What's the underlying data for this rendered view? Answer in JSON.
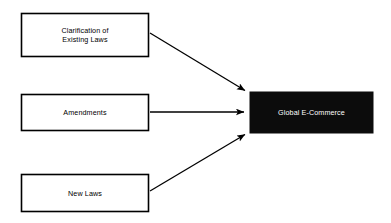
{
  "diagram": {
    "type": "flow-convergence",
    "background_color": "#ffffff",
    "source_nodes": [
      {
        "id": "clarification-of-existing-laws",
        "label": "Clarification of\nExisting Laws",
        "fill_color": "#ffffff",
        "border_color": "#000000",
        "text_color": "#000000",
        "x": 21,
        "y": 13,
        "width": 128,
        "height": 44
      },
      {
        "id": "amendments",
        "label": "Amendments",
        "fill_color": "#ffffff",
        "border_color": "#000000",
        "text_color": "#000000",
        "x": 21,
        "y": 94,
        "width": 128,
        "height": 37
      },
      {
        "id": "new-laws",
        "label": "New Laws",
        "fill_color": "#ffffff",
        "border_color": "#000000",
        "text_color": "#000000",
        "x": 21,
        "y": 174,
        "width": 128,
        "height": 38
      }
    ],
    "target_node": {
      "id": "global-e-commerce",
      "label": "Global E-Commerce",
      "fill_color": "#0c0c0c",
      "border_color": "#0c0c0c",
      "text_color": "#ffffff",
      "x": 250,
      "y": 92,
      "width": 123,
      "height": 41
    },
    "connectors": [
      {
        "id": "arrow-clarification-to-global",
        "from": "clarification-of-existing-laws",
        "to": "global-e-commerce",
        "x1": 150,
        "y1": 33,
        "x2": 247,
        "y2": 92,
        "color": "#000000"
      },
      {
        "id": "arrow-amendments-to-global",
        "from": "amendments",
        "to": "global-e-commerce",
        "x1": 150,
        "y1": 112,
        "x2": 247,
        "y2": 112,
        "color": "#000000"
      },
      {
        "id": "arrow-new-laws-to-global",
        "from": "new-laws",
        "to": "global-e-commerce",
        "x1": 150,
        "y1": 191,
        "x2": 247,
        "y2": 133,
        "color": "#000000"
      }
    ]
  }
}
